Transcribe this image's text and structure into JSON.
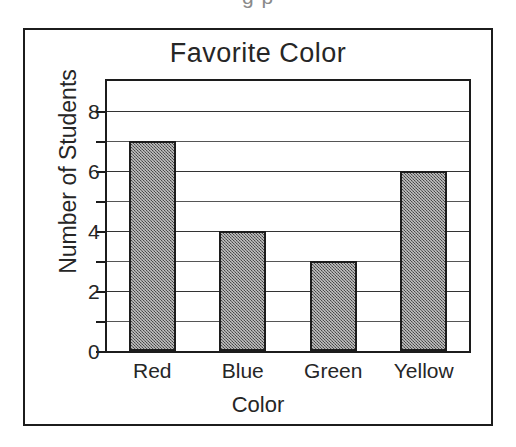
{
  "clipped_caption": "g p",
  "chart_data": {
    "type": "bar",
    "title": "Favorite Color",
    "xlabel": "Color",
    "ylabel": "Number of Students",
    "categories": [
      "Red",
      "Blue",
      "Green",
      "Yellow"
    ],
    "values": [
      7,
      4,
      3,
      6
    ],
    "ylim": [
      0,
      9
    ],
    "ytick_labels": [
      "0",
      "2",
      "4",
      "6",
      "8"
    ],
    "ytick_values": [
      0,
      2,
      4,
      6,
      8
    ],
    "gridline_values": [
      1,
      2,
      3,
      4,
      5,
      6,
      7,
      8
    ],
    "grid": true,
    "legend": "none",
    "bar_color": "#6e6e6e",
    "bar_edge_color": "#1c1c1c",
    "background": "#ffffff"
  }
}
